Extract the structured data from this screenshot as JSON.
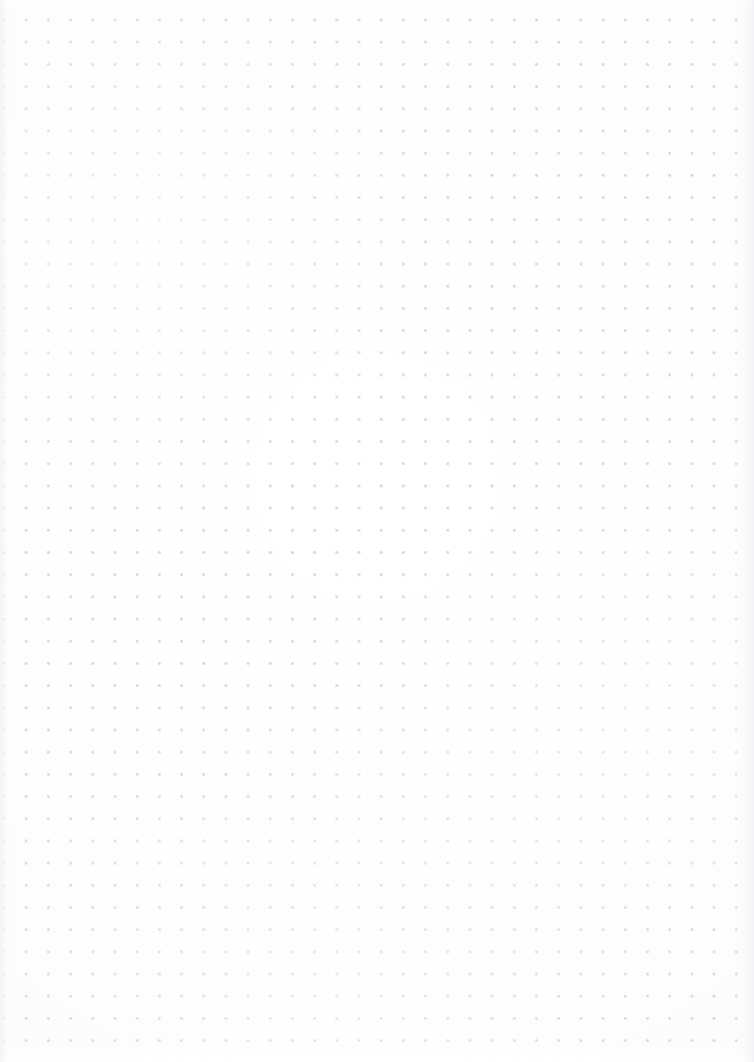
{
  "page": {
    "name": "dot-grid-page",
    "width_px": 754,
    "height_px": 1062,
    "background_color": "#fdfdfd",
    "content_text": ""
  },
  "grid": {
    "pattern": "dot-grid",
    "dot_color": "#d6d6dc",
    "dot_halo_color": "#e4e4ea",
    "dot_diameter_px": 2,
    "spacing_x_px": 22.2,
    "spacing_y_px": 22.2,
    "first_dot_x_px": 4,
    "first_dot_y_px": 20,
    "columns": 34,
    "rows": 47
  },
  "edges": {
    "left_shade_color": "#f4f4f7",
    "right_shade_color": "#f3f3f6",
    "top_margin_px": 10,
    "bottom_margin_px": 20
  }
}
